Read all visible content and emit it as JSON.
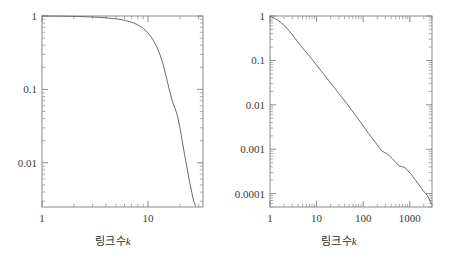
{
  "figure": {
    "background_color": "#ffffff",
    "line_color": "#6b6b6b",
    "axis_color": "#8a8a8a",
    "text_color": "#3a3a3a",
    "panel_count": 2
  },
  "panels": [
    {
      "id": "left",
      "x_caption_label": "링크수",
      "x_caption_var": "k",
      "x_tick_labels": [
        "1",
        "10"
      ],
      "y_tick_labels": [
        "1",
        "0.1",
        "0.01"
      ]
    },
    {
      "id": "right",
      "x_caption_label": "링크수",
      "x_caption_var": "k",
      "x_tick_labels": [
        "1",
        "10",
        "100",
        "1000"
      ],
      "y_tick_labels": [
        "1",
        "0.1",
        "0.01",
        "0.001",
        "0.0001"
      ]
    }
  ],
  "chart_data": [
    {
      "type": "line",
      "title": "",
      "subtitle": "",
      "xlabel": "링크수 k",
      "ylabel": "",
      "xscale": "log",
      "yscale": "log",
      "xlim": [
        1,
        33
      ],
      "ylim": [
        0.0025,
        1
      ],
      "grid": false,
      "legend": null,
      "xtick_values": [
        1,
        10
      ],
      "xtick_labels": [
        "1",
        "10"
      ],
      "ytick_values": [
        1,
        0.1,
        0.01
      ],
      "ytick_labels": [
        "1",
        "0.1",
        "0.01"
      ],
      "series": [
        {
          "name": "cumulative degree distribution (random network)",
          "x": [
            1,
            1.6,
            2.2,
            3,
            4,
            5,
            6,
            7,
            8,
            9,
            10,
            11,
            12,
            13,
            14,
            15,
            16,
            17,
            18,
            19,
            20,
            21,
            22,
            23,
            24,
            25,
            26,
            27,
            28
          ],
          "y": [
            1.0,
            0.995,
            0.985,
            0.97,
            0.945,
            0.915,
            0.875,
            0.825,
            0.76,
            0.68,
            0.59,
            0.49,
            0.39,
            0.295,
            0.21,
            0.14,
            0.095,
            0.068,
            0.055,
            0.043,
            0.03,
            0.02,
            0.0135,
            0.0095,
            0.0068,
            0.005,
            0.0038,
            0.003,
            0.0026
          ]
        }
      ]
    },
    {
      "type": "line",
      "title": "",
      "subtitle": "",
      "xlabel": "링크수 k",
      "ylabel": "",
      "xscale": "log",
      "yscale": "log",
      "xlim": [
        1,
        3000
      ],
      "ylim": [
        5e-05,
        1
      ],
      "grid": false,
      "legend": null,
      "xtick_values": [
        1,
        10,
        100,
        1000
      ],
      "xtick_labels": [
        "1",
        "10",
        "100",
        "1000"
      ],
      "ytick_values": [
        1,
        0.1,
        0.01,
        0.001,
        0.0001
      ],
      "ytick_labels": [
        "1",
        "0.1",
        "0.01",
        "0.001",
        "0.0001"
      ],
      "series": [
        {
          "name": "cumulative degree distribution (scale-free network)",
          "x": [
            1,
            1.5,
            2,
            2.5,
            3,
            4,
            5,
            7,
            10,
            14,
            20,
            30,
            45,
            65,
            90,
            130,
            180,
            250,
            330,
            420,
            520,
            600,
            660,
            700,
            780,
            900,
            1050,
            1250,
            1500,
            1800,
            2100,
            2400,
            2700,
            2900
          ],
          "y": [
            1.0,
            0.8,
            0.62,
            0.48,
            0.38,
            0.255,
            0.19,
            0.125,
            0.078,
            0.05,
            0.031,
            0.018,
            0.0105,
            0.0063,
            0.0039,
            0.0023,
            0.00145,
            0.00092,
            0.00078,
            0.00062,
            0.00048,
            0.00042,
            0.00041,
            0.0004,
            0.00039,
            0.00033,
            0.00028,
            0.00022,
            0.00017,
            0.00013,
            0.000105,
            9e-05,
            7e-05,
            6e-05
          ]
        }
      ]
    }
  ]
}
